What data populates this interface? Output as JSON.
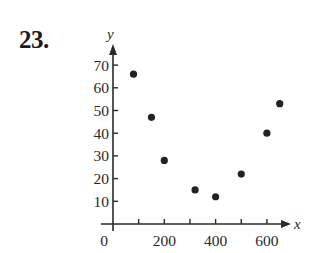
{
  "problem": {
    "number": "23."
  },
  "chart_data": {
    "type": "scatter",
    "title": "",
    "xlabel": "x",
    "ylabel": "y",
    "xlim": [
      0,
      680
    ],
    "ylim": [
      0,
      75
    ],
    "grid": false,
    "legend": null,
    "x_ticks": [
      0,
      100,
      200,
      300,
      400,
      500,
      600
    ],
    "x_tick_labels": [
      "0",
      "",
      "200",
      "",
      "400",
      "",
      "600"
    ],
    "y_ticks": [
      10,
      20,
      30,
      40,
      50,
      60,
      70
    ],
    "y_tick_labels": [
      "10",
      "20",
      "30",
      "40",
      "50",
      "60",
      "70"
    ],
    "points": [
      {
        "x": 80,
        "y": 66
      },
      {
        "x": 150,
        "y": 47
      },
      {
        "x": 200,
        "y": 28
      },
      {
        "x": 320,
        "y": 15
      },
      {
        "x": 400,
        "y": 12
      },
      {
        "x": 500,
        "y": 22
      },
      {
        "x": 600,
        "y": 40
      },
      {
        "x": 650,
        "y": 53
      }
    ],
    "colors": {
      "ink": "#2a2a2a",
      "point": "#222222"
    }
  }
}
